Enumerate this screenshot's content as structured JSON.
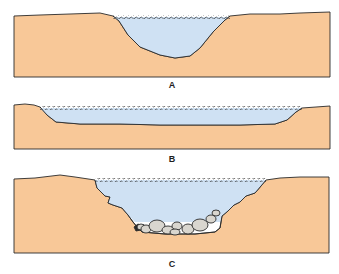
{
  "colors": {
    "ground": "#f8c898",
    "water": "#cfe1f3",
    "outline": "#2a2a2a",
    "rock": "#d9d6cf",
    "background": "#ffffff"
  },
  "panels": [
    {
      "id": "A",
      "label": "A",
      "description": "V/U-shaped narrow deep channel cross-section filled with water"
    },
    {
      "id": "B",
      "label": "B",
      "description": "Wide shallow channel cross-section filled with water"
    },
    {
      "id": "C",
      "label": "C",
      "description": "Irregular stepped channel cross-section with rounded boulders on the bed"
    }
  ]
}
